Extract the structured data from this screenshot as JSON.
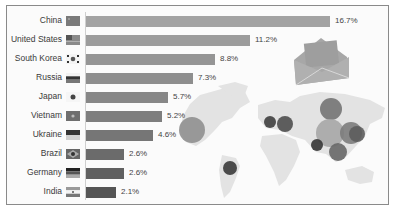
{
  "chart_data": {
    "type": "bar",
    "orientation": "horizontal",
    "title": "",
    "xlabel": "",
    "ylabel": "",
    "categories": [
      "China",
      "United States",
      "South Korea",
      "Russia",
      "Japan",
      "Vietnam",
      "Ukraine",
      "Brazil",
      "Germany",
      "India"
    ],
    "values": [
      16.7,
      11.2,
      8.8,
      7.3,
      5.7,
      5.2,
      4.6,
      2.6,
      2.6,
      2.1
    ],
    "value_labels": [
      "16.7%",
      "11.2%",
      "8.8%",
      "7.3%",
      "5.7%",
      "5.2%",
      "4.6%",
      "2.6%",
      "2.6%",
      "2.1%"
    ],
    "unit": "%",
    "grid": false,
    "legend": "none",
    "background": "world map with bubbles per country and envelope (email/spam) icon"
  },
  "rows": [
    {
      "label": "China",
      "value": "16.7%",
      "flag": "china-flag-icon",
      "end": 330,
      "color": "#a3a3a3"
    },
    {
      "label": "United States",
      "value": "11.2%",
      "flag": "united-states-flag-icon",
      "end": 250,
      "color": "#9c9c9c"
    },
    {
      "label": "South Korea",
      "value": "8.8%",
      "flag": "south-korea-flag-icon",
      "end": 215,
      "color": "#959595"
    },
    {
      "label": "Russia",
      "value": "7.3%",
      "flag": "russia-flag-icon",
      "end": 193,
      "color": "#8e8e8e"
    },
    {
      "label": "Japan",
      "value": "5.7%",
      "flag": "japan-flag-icon",
      "end": 168,
      "color": "#878787"
    },
    {
      "label": "Vietnam",
      "value": "5.2%",
      "flag": "vietnam-flag-icon",
      "end": 162,
      "color": "#7e7e7e"
    },
    {
      "label": "Ukraine",
      "value": "4.6%",
      "flag": "ukraine-flag-icon",
      "end": 153,
      "color": "#767676"
    },
    {
      "label": "Brazil",
      "value": "2.6%",
      "flag": "brazil-flag-icon",
      "end": 124,
      "color": "#6b6b6b"
    },
    {
      "label": "Germany",
      "value": "2.6%",
      "flag": "germany-flag-icon",
      "end": 124,
      "color": "#606060"
    },
    {
      "label": "India",
      "value": "2.1%",
      "flag": "india-flag-icon",
      "end": 116,
      "color": "#555555"
    }
  ],
  "bubbles": [
    {
      "country": "United States",
      "cx": 192,
      "cy": 130,
      "r": 13,
      "color": "#8f8f8f"
    },
    {
      "country": "Brazil",
      "cx": 230,
      "cy": 168,
      "r": 7,
      "color": "#3a3a3a"
    },
    {
      "country": "Germany",
      "cx": 270,
      "cy": 122,
      "r": 6,
      "color": "#3e3e3e"
    },
    {
      "country": "Ukraine",
      "cx": 285,
      "cy": 124,
      "r": 8,
      "color": "#4e4e4e"
    },
    {
      "country": "Russia",
      "cx": 331,
      "cy": 109,
      "r": 11,
      "color": "#737373"
    },
    {
      "country": "China",
      "cx": 330,
      "cy": 133,
      "r": 14,
      "color": "#a6a6a6"
    },
    {
      "country": "South Korea",
      "cx": 351,
      "cy": 133,
      "r": 11,
      "color": "#7c7c7c"
    },
    {
      "country": "Japan",
      "cx": 357,
      "cy": 134,
      "r": 8,
      "color": "#5d5d5d"
    },
    {
      "country": "India",
      "cx": 317,
      "cy": 145,
      "r": 6,
      "color": "#353535"
    },
    {
      "country": "Vietnam",
      "cx": 338,
      "cy": 152,
      "r": 9,
      "color": "#676767"
    }
  ],
  "icons": {
    "envelope": "envelope-icon"
  }
}
